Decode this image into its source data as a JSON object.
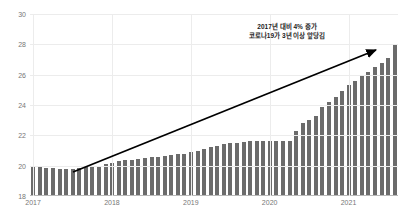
{
  "top_clip_text": "  ",
  "chart_data": {
    "type": "bar",
    "title": "",
    "subtitle": "",
    "xlabel": "",
    "ylabel": "",
    "ylim": [
      18,
      30
    ],
    "yticks": [
      18,
      20,
      22,
      24,
      26,
      28,
      30
    ],
    "ytick_labels": [
      "18",
      "20",
      "22",
      "24",
      "26",
      "28",
      "30"
    ],
    "xticks": [
      0,
      12,
      24,
      36,
      48
    ],
    "xtick_labels": [
      "2017",
      "2018",
      "2019",
      "2020",
      "2021"
    ],
    "grid": true,
    "legend": "none",
    "bar_color": "#6b6b6b",
    "grid_color": "#ececec",
    "axis_color": "#b9b9b9",
    "tick_label_color": "#777777",
    "categories": [
      "2017-01",
      "2017-02",
      "2017-03",
      "2017-04",
      "2017-05",
      "2017-06",
      "2017-07",
      "2017-08",
      "2017-09",
      "2017-10",
      "2017-11",
      "2017-12",
      "2018-01",
      "2018-02",
      "2018-03",
      "2018-04",
      "2018-05",
      "2018-06",
      "2018-07",
      "2018-08",
      "2018-09",
      "2018-10",
      "2018-11",
      "2018-12",
      "2019-01",
      "2019-02",
      "2019-03",
      "2019-04",
      "2019-05",
      "2019-06",
      "2019-07",
      "2019-08",
      "2019-09",
      "2019-10",
      "2019-11",
      "2019-12",
      "2020-01",
      "2020-02",
      "2020-03",
      "2020-04",
      "2020-05",
      "2020-06",
      "2020-07",
      "2020-08",
      "2020-09",
      "2020-10",
      "2020-11",
      "2020-12",
      "2021-01",
      "2021-02",
      "2021-03",
      "2021-04",
      "2021-05",
      "2021-06",
      "2021-07",
      "2021-08"
    ],
    "values": [
      19.9,
      19.9,
      19.85,
      19.85,
      19.8,
      19.8,
      19.8,
      19.85,
      19.9,
      19.95,
      20.0,
      20.1,
      20.2,
      20.3,
      20.35,
      20.4,
      20.45,
      20.5,
      20.55,
      20.6,
      20.65,
      20.7,
      20.75,
      20.8,
      20.9,
      21.0,
      21.1,
      21.2,
      21.3,
      21.4,
      21.5,
      21.5,
      21.55,
      21.6,
      21.6,
      21.6,
      21.6,
      21.6,
      21.6,
      21.6,
      22.3,
      22.8,
      23.0,
      23.3,
      23.9,
      24.2,
      24.5,
      24.9,
      25.3,
      25.6,
      25.9,
      26.2,
      26.5,
      26.8,
      27.1,
      28.0
    ],
    "annotations": [
      {
        "name": "growth-callout",
        "line1": "2017년 대비 4% 증가",
        "line2": "코로나19가 3년 이상 앞당김"
      }
    ],
    "trend_arrow": {
      "name": "trend-arrow",
      "x1": 73,
      "y1": 172,
      "x2": 376,
      "y2": 50,
      "color": "#000000",
      "width": 1.8
    }
  }
}
